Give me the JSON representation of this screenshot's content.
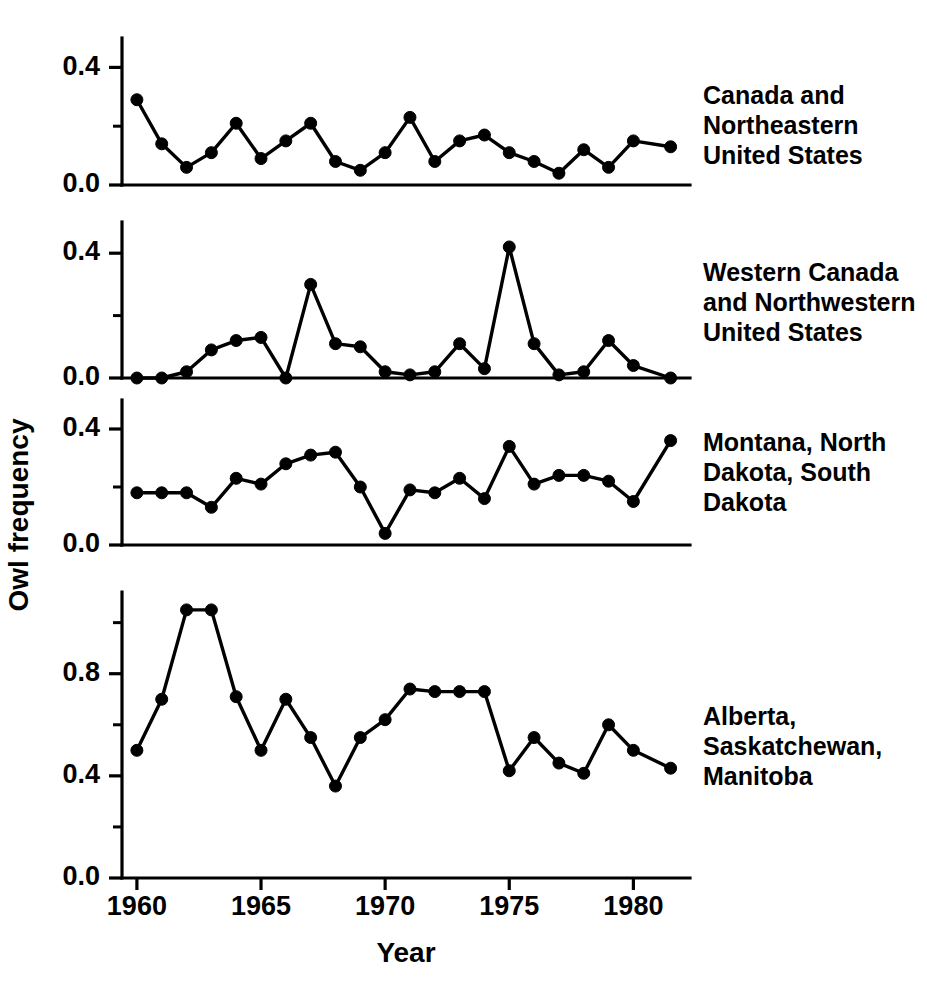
{
  "figure": {
    "xlabel": "Year",
    "ylabel": "Owl frequency",
    "xticks": [
      "1960",
      "1965",
      "1970",
      "1975",
      "1980"
    ],
    "xtick_values": [
      1960,
      1965,
      1970,
      1975,
      1980
    ],
    "xlim": [
      1959.4,
      1982.2
    ],
    "background": "#ffffff",
    "ink": "#000000"
  },
  "chart_data": [
    {
      "type": "line",
      "panel": 1,
      "label": "Canada and Northeastern United States",
      "label_lines": [
        "Canada and",
        "Northeastern",
        "United States"
      ],
      "title": "",
      "xlabel": "",
      "ylabel": "Owl frequency",
      "ylim": [
        0.0,
        0.5
      ],
      "yticks": [
        0.0,
        0.4
      ],
      "ytick_labels": [
        "0.0",
        "0.4"
      ],
      "yminor": [
        0.2
      ],
      "grid": false,
      "x": [
        1960,
        1961,
        1962,
        1963,
        1964,
        1965,
        1966,
        1967,
        1968,
        1969,
        1970,
        1971,
        1972,
        1973,
        1974,
        1975,
        1976,
        1977,
        1978,
        1979,
        1980,
        1981.5
      ],
      "values": [
        0.29,
        0.14,
        0.06,
        0.11,
        0.21,
        0.09,
        0.15,
        0.21,
        0.08,
        0.05,
        0.11,
        0.23,
        0.08,
        0.15,
        0.17,
        0.11,
        0.08,
        0.04,
        0.12,
        0.06,
        0.15,
        0.13
      ]
    },
    {
      "type": "line",
      "panel": 2,
      "label": "Western Canada and Northwestern United States",
      "label_lines": [
        "Western Canada",
        "and Northwestern",
        "United States"
      ],
      "title": "",
      "xlabel": "",
      "ylabel": "Owl frequency",
      "ylim": [
        0.0,
        0.5
      ],
      "yticks": [
        0.0,
        0.4
      ],
      "ytick_labels": [
        "0.0",
        "0.4"
      ],
      "yminor": [
        0.2
      ],
      "grid": false,
      "x": [
        1960,
        1961,
        1962,
        1963,
        1964,
        1965,
        1966,
        1967,
        1968,
        1969,
        1970,
        1971,
        1972,
        1973,
        1974,
        1975,
        1976,
        1977,
        1978,
        1979,
        1980,
        1981.5
      ],
      "values": [
        0.0,
        0.0,
        0.02,
        0.09,
        0.12,
        0.13,
        0.0,
        0.3,
        0.11,
        0.1,
        0.02,
        0.01,
        0.02,
        0.11,
        0.03,
        0.42,
        0.11,
        0.01,
        0.02,
        0.12,
        0.04,
        0.0
      ]
    },
    {
      "type": "line",
      "panel": 3,
      "label": "Montana, North Dakota, South Dakota",
      "label_lines": [
        "Montana, North",
        "Dakota, South",
        "Dakota"
      ],
      "title": "",
      "xlabel": "",
      "ylabel": "Owl frequency",
      "ylim": [
        0.0,
        0.5
      ],
      "yticks": [
        0.0,
        0.4
      ],
      "ytick_labels": [
        "0.0",
        "0.4"
      ],
      "yminor": [
        0.2
      ],
      "grid": false,
      "x": [
        1960,
        1961,
        1962,
        1963,
        1964,
        1965,
        1966,
        1967,
        1968,
        1969,
        1970,
        1971,
        1972,
        1973,
        1974,
        1975,
        1976,
        1977,
        1978,
        1979,
        1980,
        1981.5
      ],
      "values": [
        0.18,
        0.18,
        0.18,
        0.13,
        0.23,
        0.21,
        0.28,
        0.31,
        0.32,
        0.2,
        0.04,
        0.19,
        0.18,
        0.23,
        0.16,
        0.34,
        0.21,
        0.24,
        0.24,
        0.22,
        0.15,
        0.36,
        0.35
      ]
    },
    {
      "type": "line",
      "panel": 4,
      "label": "Alberta, Saskatchewan, Manitoba",
      "label_lines": [
        "Alberta,",
        "Saskatchewan,",
        "Manitoba"
      ],
      "title": "",
      "xlabel": "",
      "ylabel": "Owl frequency",
      "ylim": [
        0.0,
        1.12
      ],
      "yticks": [
        0.0,
        0.4,
        0.8
      ],
      "ytick_labels": [
        "0.0",
        "0.4",
        "0.8"
      ],
      "yminor": [
        0.2,
        0.6,
        1.0
      ],
      "grid": false,
      "x": [
        1960,
        1961,
        1962,
        1963,
        1964,
        1965,
        1966,
        1967,
        1968,
        1969,
        1970,
        1971,
        1972,
        1973,
        1974,
        1975,
        1976,
        1977,
        1978,
        1979,
        1980,
        1981.5
      ],
      "values": [
        0.5,
        0.7,
        1.05,
        1.05,
        0.71,
        0.5,
        0.7,
        0.55,
        0.36,
        0.55,
        0.62,
        0.74,
        0.73,
        0.73,
        0.73,
        0.42,
        0.55,
        0.45,
        0.41,
        0.6,
        0.5,
        0.43
      ]
    }
  ]
}
